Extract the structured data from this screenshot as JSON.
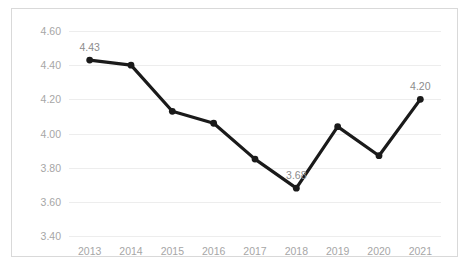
{
  "title_sliver": "",
  "chart_data": {
    "type": "line",
    "title": "",
    "xlabel": "",
    "ylabel": "",
    "categories": [
      "2013",
      "2014",
      "2015",
      "2016",
      "2017",
      "2018",
      "2019",
      "2020",
      "2021"
    ],
    "values": [
      4.43,
      4.4,
      4.13,
      4.06,
      3.85,
      3.68,
      4.04,
      3.87,
      4.2
    ],
    "ylim": [
      3.4,
      4.6
    ],
    "ytick_step": 0.2,
    "yticks": [
      "3.40",
      "3.60",
      "3.80",
      "4.00",
      "4.20",
      "4.40",
      "4.60"
    ],
    "ytick_values": [
      3.4,
      3.6,
      3.8,
      4.0,
      4.2,
      4.4,
      4.6
    ],
    "grid": true,
    "legend": "none",
    "point_labels": [
      {
        "category": "2013",
        "value": 4.43,
        "text": "4.43"
      },
      {
        "category": "2018",
        "value": 3.68,
        "text": "3.68"
      },
      {
        "category": "2021",
        "value": 4.2,
        "text": "4.20"
      }
    ],
    "colors": {
      "line": "#1a1a1a",
      "marker": "#1a1a1a",
      "grid": "#ededed",
      "tick_text": "#a6a6a6",
      "label_text": "#8c8c8c",
      "border": "#d9d9d9",
      "background": "#ffffff"
    }
  }
}
